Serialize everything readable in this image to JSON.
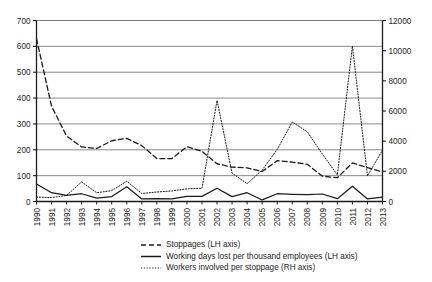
{
  "chart_data": {
    "type": "line",
    "title": "",
    "xlabel": "",
    "ylabel": "",
    "grid": true,
    "legend_position": "bottom-left",
    "x": [
      "1990",
      "1991",
      "1992",
      "1993",
      "1994",
      "1995",
      "1996",
      "1997",
      "1998",
      "1999",
      "2000",
      "2001",
      "2002",
      "2003",
      "2004",
      "2005",
      "2006",
      "2007",
      "2008",
      "2009",
      "2010",
      "2011",
      "2012",
      "2013"
    ],
    "left_axis": {
      "label": "LH axis",
      "min": 0,
      "max": 700,
      "step": 100,
      "ticks": [
        "0",
        "100",
        "200",
        "300",
        "400",
        "500",
        "600",
        "700"
      ]
    },
    "right_axis": {
      "label": "RH axis",
      "min": 0,
      "max": 12000,
      "step": 2000,
      "ticks": [
        "0",
        "2000",
        "4000",
        "6000",
        "8000",
        "10000",
        "12000"
      ]
    },
    "series": [
      {
        "name": "Stoppages (LH axis)",
        "axis": "left",
        "style": "dashed",
        "values": [
          630,
          369,
          253,
          211,
          205,
          235,
          244,
          216,
          166,
          166,
          212,
          194,
          146,
          133,
          130,
          116,
          158,
          152,
          144,
          98,
          92,
          149,
          131,
          114
        ]
      },
      {
        "name": "Working days lost per thousand employees (LH axis)",
        "axis": "left",
        "style": "solid",
        "values": [
          68,
          34,
          24,
          30,
          13,
          19,
          57,
          10,
          11,
          10,
          20,
          20,
          51,
          19,
          34,
          6,
          30,
          28,
          27,
          29,
          11,
          59,
          10,
          17
        ]
      },
      {
        "name": "Workers involved per stoppage (RH axis)",
        "axis": "right",
        "style": "dotted",
        "values": [
          290,
          260,
          400,
          1300,
          580,
          720,
          1340,
          530,
          630,
          700,
          840,
          880,
          6700,
          1880,
          1180,
          2080,
          3450,
          5270,
          4620,
          3150,
          1760,
          10300,
          1700,
          3400
        ]
      }
    ],
    "legend": [
      {
        "label": "Stoppages (LH axis)",
        "style": "dashed"
      },
      {
        "label": "Working days lost per thousand employees (LH axis)",
        "style": "solid"
      },
      {
        "label": "Workers involved per stoppage (RH axis)",
        "style": "dotted"
      }
    ]
  }
}
